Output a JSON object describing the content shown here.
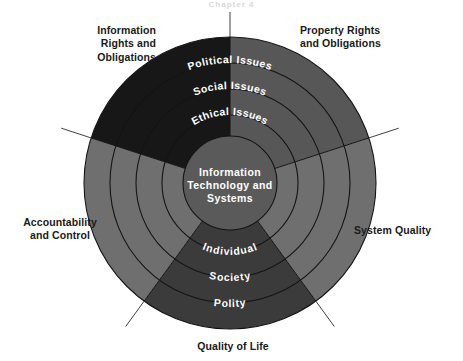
{
  "page": {
    "heading": "Chapter 4",
    "background_color": "#ffffff"
  },
  "diagram": {
    "center": {
      "line1": "Information",
      "line2": "Technology and",
      "line3": "Systems"
    },
    "rings_top": [
      {
        "name": "political-issues",
        "label": "Political  Issues"
      },
      {
        "name": "social-issues",
        "label": "Social  Issues"
      },
      {
        "name": "ethical-issues",
        "label": "Ethical  Issues"
      }
    ],
    "rings_bottom": [
      {
        "name": "individual",
        "label": "Individual"
      },
      {
        "name": "society",
        "label": "Society"
      },
      {
        "name": "polity",
        "label": "Polity"
      }
    ],
    "dimensions": {
      "outer_labels": [
        {
          "name": "information-rights-and-obligations",
          "label": "Information\nRights and\nObligations"
        },
        {
          "name": "property-rights-and-obligations",
          "label": "Property Rights\nand Obligations"
        },
        {
          "name": "accountability-and-control",
          "label": "Accountability\nand Control"
        },
        {
          "name": "system-quality",
          "label": "System Quality"
        },
        {
          "name": "quality-of-life",
          "label": "Quality of Life"
        }
      ]
    },
    "colors": {
      "sector_information_rights": "#171717",
      "sector_property_rights": "#575757",
      "sector_system_quality": "#6f6f6f",
      "sector_quality_of_life": "#3b3b3b",
      "sector_accountability": "#6f6f6f",
      "core_disc": "#5a5a5a",
      "ring_stroke": "#141414",
      "pointer_line": "#2b2b2b",
      "label_text": "#1a1a1a",
      "ring_label_text": "#ffffff"
    }
  }
}
